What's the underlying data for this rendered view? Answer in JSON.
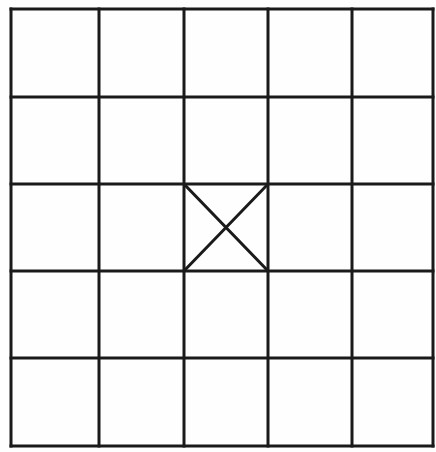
{
  "diagram": {
    "type": "grid",
    "rows": 5,
    "cols": 5,
    "line_color": "#1a1a1a",
    "background": "#fefefe",
    "col_lines_x": [
      11,
      99,
      184,
      268,
      352,
      433
    ],
    "row_lines_y": [
      9,
      97,
      184,
      271,
      358,
      446
    ],
    "marked_cells": [
      {
        "row": 2,
        "col": 2,
        "mark": "X"
      }
    ]
  }
}
